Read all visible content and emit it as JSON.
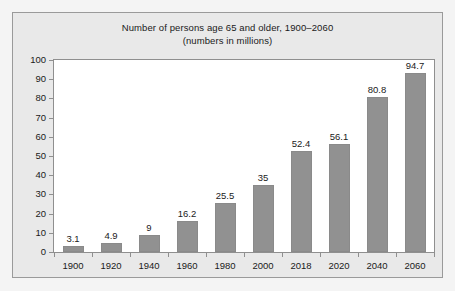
{
  "chart_data": {
    "type": "bar",
    "title": "Number of persons age 65 and older, 1900–2060",
    "subtitle": "(numbers in millions)",
    "xlabel": "",
    "ylabel": "",
    "categories": [
      "1900",
      "1920",
      "1940",
      "1960",
      "1980",
      "2000",
      "2018",
      "2020",
      "2040",
      "2060"
    ],
    "values": [
      3.1,
      4.9,
      9,
      16.2,
      25.5,
      35,
      52.4,
      56.1,
      80.8,
      94.7
    ],
    "value_labels": [
      "3.1",
      "4.9",
      "9",
      "16.2",
      "25.5",
      "35",
      "52.4",
      "56.1",
      "80.8",
      "94.7"
    ],
    "ylim": [
      0,
      100
    ],
    "ytick_step": 10,
    "yticks": [
      100,
      90,
      80,
      70,
      60,
      50,
      40,
      30,
      20,
      10,
      0
    ],
    "ytick_labels": [
      "100",
      "90",
      "80",
      "70",
      "60",
      "50",
      "40",
      "30",
      "20",
      "10",
      "0"
    ],
    "grid": false,
    "legend": null,
    "bar_color": "#919191",
    "plot_background": "#ffffff",
    "figure_background": "#e9e9e9",
    "text_color": "#1a1a1a",
    "axis_color": "#8f8f8f"
  }
}
